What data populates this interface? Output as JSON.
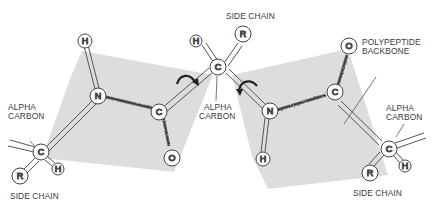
{
  "diagram": {
    "type": "peptide-bond-planes",
    "colors": {
      "plane": "#dcdcdc",
      "bond": "#555555",
      "atom_fill": "#ffffff",
      "atom_stroke": "#444444",
      "label": "#3a3a3a"
    },
    "labels": {
      "side_chain_top": "SIDE CHAIN",
      "side_chain_left": "SIDE CHAIN",
      "side_chain_right": "SIDE CHAIN",
      "alpha_carbon_left_1": "ALPHA",
      "alpha_carbon_left_2": "CARBON",
      "alpha_carbon_center_1": "ALPHA",
      "alpha_carbon_center_2": "CARBON",
      "alpha_carbon_right_1": "ALPHA",
      "alpha_carbon_right_2": "CARBON",
      "backbone_1": "POLYPEPTIDE",
      "backbone_2": "BACKBONE"
    },
    "atoms": {
      "h_left_n": "H",
      "n_left": "N",
      "c_left": "C",
      "o_left": "O",
      "ca_left": "C",
      "h_ca_left": "H",
      "r_left": "R",
      "ca_center": "C",
      "h_center": "H",
      "r_center": "R",
      "n_right": "N",
      "h_right_n": "H",
      "c_right": "C",
      "o_right": "O",
      "ca_right": "C",
      "h_ca_right": "H",
      "r_right": "R"
    }
  }
}
